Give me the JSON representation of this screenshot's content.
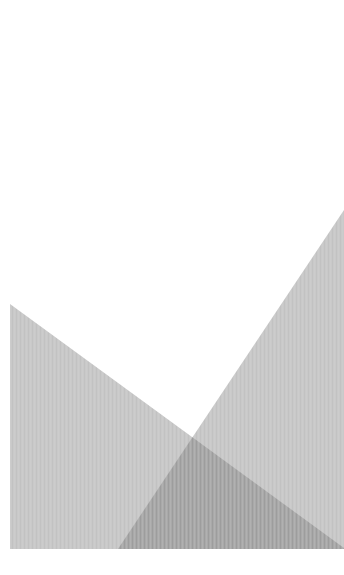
{
  "artwork": {
    "description": "Abstract composition of two overlapping gray triangles on white",
    "background_color": "#ffffff",
    "shapes": [
      {
        "name": "left-triangle",
        "fill": "#c9c9c9"
      },
      {
        "name": "right-triangle",
        "fill": "#c9c9c9"
      }
    ],
    "overlap_fill": "#a9a9a9",
    "texture": "vertical-stripes"
  }
}
